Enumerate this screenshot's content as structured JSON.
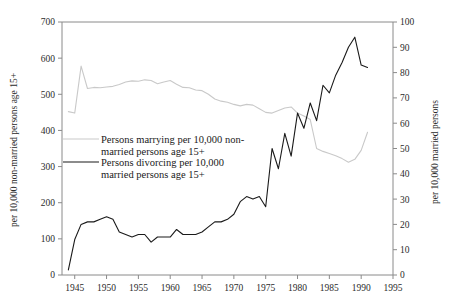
{
  "chart_data": {
    "type": "line",
    "title": "",
    "xlabel": "",
    "ylabel": "per 10,000 non-married persons age 15+",
    "y2label": "per 10,000 married persons",
    "xlim": [
      1943,
      1995
    ],
    "ylim": [
      0,
      700
    ],
    "y2lim": [
      0,
      100
    ],
    "grid": false,
    "legend_position": "center-left",
    "x_ticks": [
      1945,
      1950,
      1955,
      1960,
      1965,
      1970,
      1975,
      1980,
      1985,
      1990,
      1995
    ],
    "y_ticks": [
      0,
      100,
      200,
      300,
      400,
      500,
      600,
      700
    ],
    "y2_ticks": [
      0,
      10,
      20,
      30,
      40,
      50,
      60,
      70,
      80,
      90,
      100
    ],
    "colors": {
      "marrying": "#c9c9c9",
      "divorcing": "#1a1a1a",
      "axis": "#8a8a8a",
      "text": "#1a1a1a"
    },
    "series": [
      {
        "name": "Persons marrying per 10,000 non-married persons age 15+",
        "axis": "left",
        "color": "#c9c9c9",
        "x": [
          1944,
          1945,
          1946,
          1947,
          1948,
          1949,
          1950,
          1951,
          1952,
          1953,
          1954,
          1955,
          1956,
          1957,
          1958,
          1959,
          1960,
          1961,
          1962,
          1963,
          1964,
          1965,
          1966,
          1967,
          1968,
          1969,
          1970,
          1971,
          1972,
          1973,
          1974,
          1975,
          1976,
          1977,
          1978,
          1979,
          1980,
          1981,
          1982,
          1983,
          1984,
          1985,
          1986,
          1987,
          1988,
          1989,
          1990,
          1991
        ],
        "values": [
          452,
          448,
          578,
          516,
          519,
          518,
          520,
          522,
          527,
          534,
          537,
          536,
          540,
          538,
          529,
          534,
          538,
          528,
          519,
          518,
          512,
          510,
          500,
          487,
          481,
          478,
          472,
          468,
          472,
          470,
          460,
          450,
          448,
          455,
          462,
          465,
          448,
          440,
          430,
          350,
          342,
          336,
          330,
          322,
          312,
          320,
          345,
          395
        ]
      },
      {
        "name": "Persons divorcing per 10,000 married persons age 15+",
        "axis": "right",
        "color": "#1a1a1a",
        "x": [
          1944,
          1945,
          1946,
          1947,
          1948,
          1949,
          1950,
          1951,
          1952,
          1953,
          1954,
          1955,
          1956,
          1957,
          1958,
          1959,
          1960,
          1961,
          1962,
          1963,
          1964,
          1965,
          1966,
          1967,
          1968,
          1969,
          1970,
          1971,
          1972,
          1973,
          1974,
          1975,
          1976,
          1977,
          1978,
          1979,
          1980,
          1981,
          1982,
          1983,
          1984,
          1985,
          1986,
          1987,
          1988,
          1989,
          1990,
          1991
        ],
        "values": [
          2,
          14,
          20,
          21,
          21,
          22,
          23,
          22,
          17,
          16,
          15,
          16,
          16,
          13,
          15,
          15,
          15,
          18,
          16,
          16,
          16,
          17,
          19,
          21,
          21,
          22,
          24,
          29,
          31,
          30,
          31,
          27,
          50,
          42,
          56,
          47,
          64,
          58,
          68,
          61,
          75,
          72,
          79,
          84,
          90,
          94,
          83,
          82
        ]
      }
    ]
  },
  "legend": {
    "entries": [
      {
        "line1": "Persons marrying per 10,000 non-",
        "line2": "married persons age 15+",
        "style": "light"
      },
      {
        "line1": "Persons divorcing per 10,000",
        "line2": "married persons age 15+",
        "style": "dark"
      }
    ]
  },
  "axes": {
    "left_title": "per 10,000 non-married persons age 15+",
    "right_title": "per 10,000 married persons"
  }
}
